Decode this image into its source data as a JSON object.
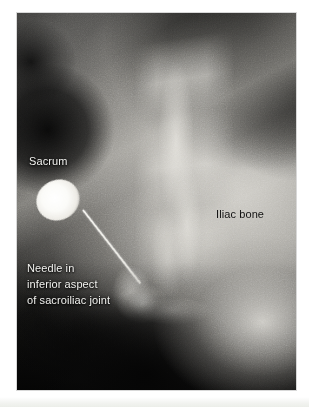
{
  "figure": {
    "kind": "radiograph",
    "modality": "fluoroscopic X-ray",
    "region": "sacroiliac joint",
    "procedure": "needle placement in inferior aspect of sacroiliac joint"
  },
  "annotations": [
    {
      "id": "sacrum",
      "text": "Sacrum",
      "style": "light",
      "target": "sacrum"
    },
    {
      "id": "needle",
      "line1": "Needle in",
      "line2": "inferior aspect",
      "line3": "of sacroiliac joint",
      "style": "light",
      "target": "needle-tip"
    },
    {
      "id": "iliac-bone",
      "text": "Iliac bone",
      "style": "dark",
      "target": "iliac-bone"
    }
  ],
  "features": {
    "needle_hub": "needle-hub",
    "needle_shaft": "needle-shaft",
    "sacral_ala": "sacral-ala",
    "si_joint": "sacroiliac-joint-line",
    "iliac_mass": "iliac-bone-mass",
    "tip_bone_edge": "inferior-si-joint-bone-edge"
  },
  "colors": {
    "page_background": "#ffffff",
    "film_dark": "#0d0d0d",
    "bone_bright": "#d6d4ce",
    "needle_metal": "#ffffff",
    "label_light": "#f2f2ef",
    "label_dark": "#111111"
  }
}
